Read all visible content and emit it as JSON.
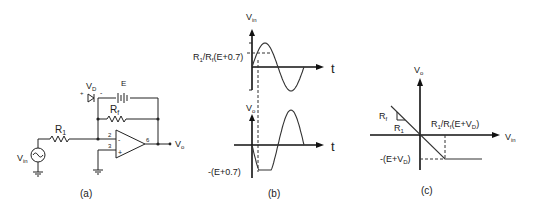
{
  "panels": {
    "a": {
      "caption": "(a)",
      "labels": {
        "vin": "V",
        "vin_sub": "in",
        "r1": "R",
        "r1_sub": "1",
        "rf": "R",
        "rf_sub": "f",
        "vd": "V",
        "vd_sub": "D",
        "vd_plus": "+",
        "vd_minus": "-",
        "e": "E",
        "pin2": "2",
        "pin3": "3",
        "pin6": "6",
        "opamp_minus": "-",
        "opamp_plus": "+",
        "vo": "V",
        "vo_sub": "o"
      }
    },
    "b": {
      "caption": "(b)",
      "top_axis": {
        "ylabel": "V",
        "ylabel_sub": "in",
        "xlabel": "t",
        "threshold_label": "R₁/Rₑ(E+0.7)"
      },
      "threshold_parts": [
        "R",
        "1",
        "/R",
        "f",
        "(E+0.7)"
      ],
      "bottom_axis": {
        "ylabel": "V",
        "ylabel_sub": "o",
        "xlabel": "t",
        "clamp_label": "-(E+0.7)"
      }
    },
    "c": {
      "caption": "(c)",
      "ylabel": "V",
      "ylabel_sub": "o",
      "xlabel": "V",
      "xlabel_sub": "in",
      "slope_rf": "R",
      "slope_rf_sub": "f",
      "slope_r1": "R",
      "slope_r1_sub": "1",
      "breakpoint_parts": [
        "R",
        "1",
        "/R",
        "f",
        "(E+V",
        "D",
        ")"
      ],
      "clamp_parts": [
        "-(E+V",
        "D",
        ")"
      ]
    }
  }
}
